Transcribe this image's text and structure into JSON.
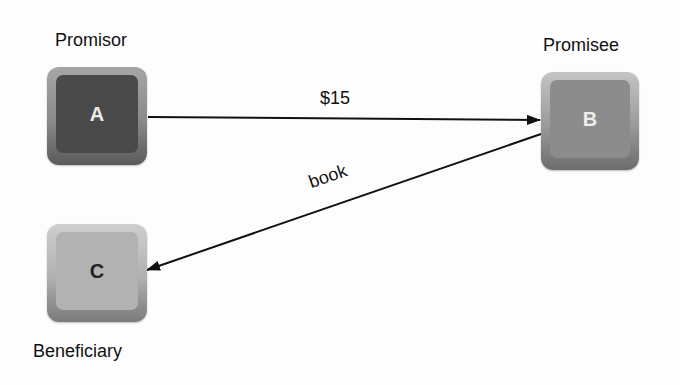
{
  "diagram": {
    "nodes": [
      {
        "id": "A",
        "letter": "A",
        "role": "Promisor",
        "fill": "#4a4a4a",
        "text_color": "#ececec"
      },
      {
        "id": "B",
        "letter": "B",
        "role": "Promisee",
        "fill": "#8c8c8c",
        "text_color": "#eeeeee"
      },
      {
        "id": "C",
        "letter": "C",
        "role": "Beneficiary",
        "fill": "#b2b2b2",
        "text_color": "#222222"
      }
    ],
    "edges": [
      {
        "from": "A",
        "to": "B",
        "label": "$15"
      },
      {
        "from": "B",
        "to": "C",
        "label": "book"
      }
    ],
    "edge_color": "#111111"
  }
}
